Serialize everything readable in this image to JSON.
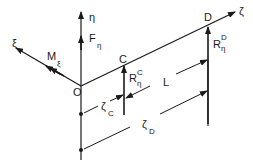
{
  "diagram": {
    "axes": {
      "eta": "η",
      "xi": "ξ",
      "zeta": "ζ"
    },
    "points": {
      "origin": "O",
      "c": "C",
      "d": "D"
    },
    "forces": {
      "f_eta": {
        "main": "F",
        "sub": "η"
      },
      "m_xi": {
        "main": "M",
        "sub": "ξ"
      },
      "r_c": {
        "main": "R",
        "sub": "η",
        "sup": "C"
      },
      "r_d": {
        "main": "R",
        "sub": "η",
        "sup": "D"
      }
    },
    "dimensions": {
      "zeta_c": {
        "main": "ζ",
        "sub": "C"
      },
      "zeta_d": {
        "main": "ζ",
        "sub": "D"
      },
      "length": "L"
    },
    "colors": {
      "ink": "#1a1a1a",
      "background": "#ffffff"
    }
  }
}
